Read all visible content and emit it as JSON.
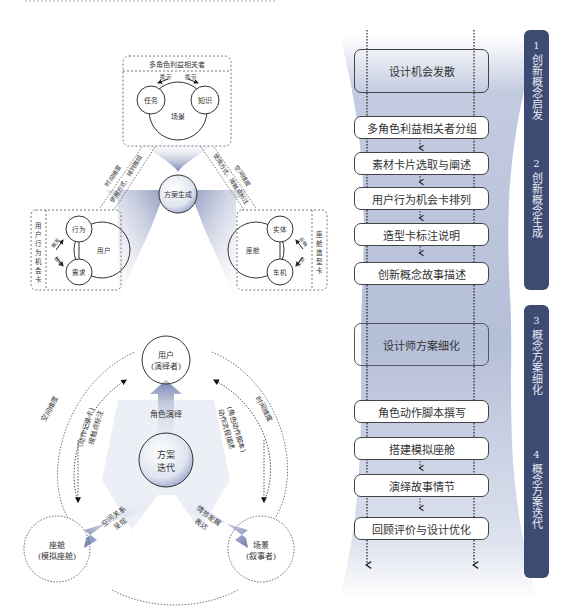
{
  "diagram_a": {
    "stakeholder_box": {
      "title": "多角色利益相关者",
      "circles": [
        "任务",
        "知识",
        "场景"
      ],
      "arrow_labels": [
        "携带",
        "携带"
      ]
    },
    "center": "方案生成",
    "left_box": {
      "title": "用户行为机会卡",
      "circles": [
        "行为",
        "需求",
        "用户"
      ],
      "arrow_labels": [
        "触发",
        "驱动"
      ]
    },
    "right_box": {
      "title": "座舱造型卡",
      "circles": [
        "实体",
        "车机",
        "座舱"
      ],
      "arrow_labels": [
        "反映",
        "反馈"
      ]
    },
    "links": {
      "left_outer": "时间维度",
      "left_inner": "使用方式、排列推组",
      "right_outer": "空间维度",
      "right_inner": "使用方式、接触点标注"
    }
  },
  "diagram_b": {
    "center": [
      "方案",
      "迭代"
    ],
    "nodes": {
      "top": [
        "用户",
        "(演绎者)"
      ],
      "left": [
        "座舱",
        "(模拟座舱)"
      ],
      "right": [
        "场景",
        "(叙事者)"
      ]
    },
    "arrows": {
      "up": "角色演绎",
      "left": [
        "空间关系",
        "呈现"
      ],
      "right": [
        "情节发展",
        "表达"
      ]
    },
    "side_labels": {
      "left_outer": "空间维度",
      "left_inner": [
        "(动作记录卡)",
        "接触点标注"
      ],
      "right_outer": "时间维度",
      "right_inner": [
        "(角色动作脚本)",
        "动作流程描述"
      ]
    }
  },
  "flow": {
    "steps": [
      {
        "label": "设计机会发散",
        "type": "stage"
      },
      {
        "label": "多角色利益相关者分组",
        "type": "task"
      },
      {
        "label": "素材卡片选取与阐述",
        "type": "task"
      },
      {
        "label": "用户行为机会卡排列",
        "type": "task"
      },
      {
        "label": "造型卡标注说明",
        "type": "task"
      },
      {
        "label": "创新概念故事描述",
        "type": "task"
      },
      {
        "label": "设计师方案细化",
        "type": "stage"
      },
      {
        "label": "角色动作脚本撰写",
        "type": "task"
      },
      {
        "label": "搭建模拟座舱",
        "type": "task"
      },
      {
        "label": "演绎故事情节",
        "type": "task"
      },
      {
        "label": "回顾评价与设计优化",
        "type": "task"
      }
    ],
    "phases": [
      {
        "num": "1",
        "label": "创新概念启发"
      },
      {
        "num": "2",
        "label": "创新概念生成"
      },
      {
        "num": "3",
        "label": "概念方案细化"
      },
      {
        "num": "4",
        "label": "概念方案迭代"
      }
    ],
    "colors": {
      "phase_bg": "#3d4a72",
      "funnel": "#b9c3da",
      "line": "#333333"
    }
  }
}
